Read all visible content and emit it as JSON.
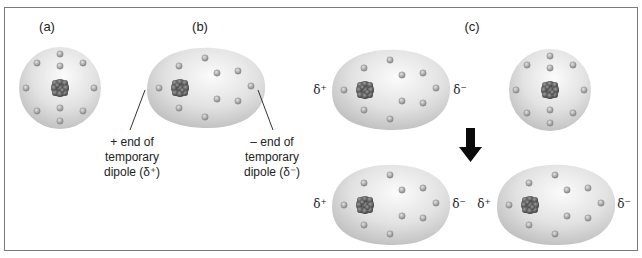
{
  "panels": {
    "a": {
      "label": "(a)"
    },
    "b": {
      "label": "(b)"
    },
    "c": {
      "label": "(c)"
    }
  },
  "captions": {
    "positive_end": [
      "+ end of",
      "temporary",
      "dipole (δ⁺)"
    ],
    "negative_end": [
      "– end of",
      "temporary",
      "dipole (δ⁻)"
    ]
  },
  "delta_labels": {
    "plus": "δ⁺",
    "minus": "δ⁻"
  },
  "icons": {
    "arrow": "down-arrow-icon"
  },
  "colors": {
    "cloud_light": "#f6f6f6",
    "cloud_dark": "#c4c4c4",
    "electron": "#8f8f8f",
    "nucleus": "#555555",
    "frame": "#7a7a7a",
    "arrow": "#0a0a0a"
  }
}
